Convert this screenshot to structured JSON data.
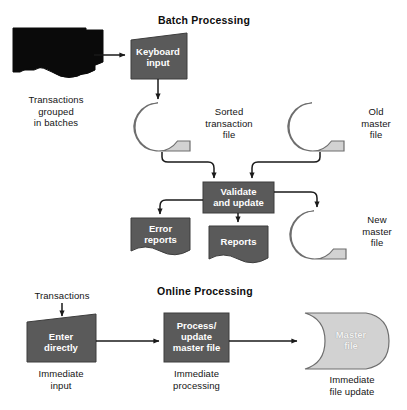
{
  "figure": {
    "background_color": "#ffffff",
    "palette": {
      "dark_fill": "#5a5a5a",
      "dark_stroke": "#3d3d3d",
      "light_fill": "#d2d2d2",
      "light_stroke": "#6e6e6e",
      "black_fill": "#0a0a0a",
      "line_color": "#1a1a1a",
      "text_dark": "#141414",
      "text_light": "#ffffff"
    }
  },
  "sections": {
    "batch": {
      "title": "Batch Processing",
      "nodes": {
        "batched_transactions": {
          "shape": "stacked-documents",
          "fill": "black",
          "label": "",
          "caption": "Transactions\ngrouped\nin batches"
        },
        "keyboard_input": {
          "shape": "manual-input",
          "fill": "dark",
          "label": "Keyboard\ninput",
          "caption": ""
        },
        "sorted_transaction_file": {
          "shape": "magnetic-tape",
          "fill": "light",
          "label": "",
          "caption": "Sorted\ntransaction\nfile"
        },
        "old_master_file": {
          "shape": "magnetic-tape",
          "fill": "light",
          "label": "",
          "caption": "Old\nmaster\nfile"
        },
        "validate_and_update": {
          "shape": "process",
          "fill": "dark",
          "label": "Validate\nand update",
          "caption": ""
        },
        "error_reports": {
          "shape": "document",
          "fill": "dark",
          "label": "Error\nreports",
          "caption": ""
        },
        "reports": {
          "shape": "document",
          "fill": "dark",
          "label": "Reports",
          "caption": ""
        },
        "new_master_file": {
          "shape": "magnetic-tape",
          "fill": "light",
          "label": "",
          "caption": "New\nmaster\nfile"
        }
      },
      "flows": [
        {
          "from": "batched_transactions",
          "to": "keyboard_input"
        },
        {
          "from": "keyboard_input",
          "to": "sorted_transaction_file"
        },
        {
          "from": "sorted_transaction_file",
          "to": "validate_and_update"
        },
        {
          "from": "old_master_file",
          "to": "validate_and_update"
        },
        {
          "from": "validate_and_update",
          "to": "error_reports"
        },
        {
          "from": "validate_and_update",
          "to": "reports"
        },
        {
          "from": "validate_and_update",
          "to": "new_master_file"
        }
      ]
    },
    "online": {
      "title": "Online Processing",
      "nodes": {
        "transactions": {
          "shape": "text-only",
          "fill": "none",
          "label": "",
          "caption": "Transactions"
        },
        "enter_directly": {
          "shape": "manual-input",
          "fill": "dark",
          "label": "Enter\ndirectly",
          "caption": "Immediate\ninput"
        },
        "process_update_master_file": {
          "shape": "process",
          "fill": "dark",
          "label": "Process/\nupdate\nmaster file",
          "caption": "Immediate\nprocessing"
        },
        "master_file": {
          "shape": "direct-access-storage",
          "fill": "light",
          "label": "Master\nfile",
          "caption": "Immediate\nfile update"
        }
      },
      "flows": [
        {
          "from": "transactions",
          "to": "enter_directly"
        },
        {
          "from": "enter_directly",
          "to": "process_update_master_file"
        },
        {
          "from": "process_update_master_file",
          "to": "master_file"
        }
      ]
    }
  }
}
